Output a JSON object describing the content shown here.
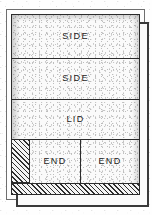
{
  "board": {
    "panels": [
      {
        "id": "side-1",
        "label": "SIDE"
      },
      {
        "id": "side-2",
        "label": "SIDE"
      },
      {
        "id": "lid",
        "label": "LID"
      },
      {
        "id": "end-1",
        "label": "END"
      },
      {
        "id": "end-2",
        "label": "END"
      }
    ],
    "waste_regions": [
      {
        "id": "waste-left",
        "fill": "diagonal-hatch"
      },
      {
        "id": "waste-bottom",
        "fill": "diagonal-hatch"
      }
    ]
  },
  "colors": {
    "ink": "#2b2b2b",
    "rule": "#2b2b2b",
    "stock": "#fafafa",
    "frame_outer": "#6e6e6e",
    "frame_inner": "#3a3a3a",
    "hatch": "#2e2e2e",
    "label_text": "#1c1c1c",
    "page": "#ffffff"
  }
}
